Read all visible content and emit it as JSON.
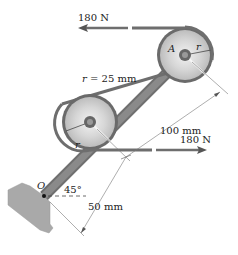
{
  "diagram": {
    "labels": {
      "force_top": "180 N",
      "force_bottom": "180 N",
      "radius_value": "r = 25 mm",
      "pulley_a": "A",
      "radius_a": "r",
      "radius_b": "r",
      "pivot": "O",
      "angle": "45°",
      "dim_long": "100 mm",
      "dim_short": "50 mm"
    },
    "colors": {
      "belt": "#6e6e6e",
      "arm": "#7a7a7a",
      "ground": "#a8a8a8",
      "pulley_rim": "#5a5a5a",
      "pulley_face": "#d9d9d9",
      "dimension": "#555555"
    }
  }
}
